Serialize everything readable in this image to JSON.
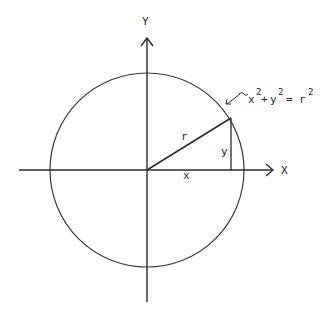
{
  "diagram": {
    "type": "unit-circle-pythagorean",
    "axes": {
      "x_label": "X",
      "y_label": "Y"
    },
    "segments": {
      "radius_label": "r",
      "horizontal_label": "x",
      "vertical_label": "y"
    },
    "equation": {
      "arrow_glyph": "↙~",
      "x_term": "x",
      "plus": "+",
      "y_term": "y",
      "equals": "=",
      "r_term": "r",
      "exponent": "2"
    },
    "colors": {
      "stroke": "#2a2a2a",
      "background": "#ffffff"
    }
  }
}
